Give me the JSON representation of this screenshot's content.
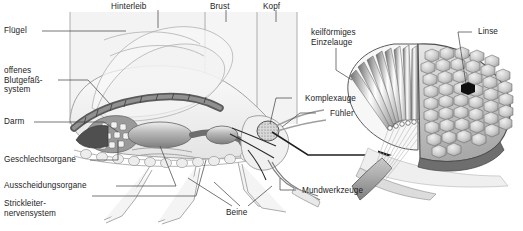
{
  "figure": {
    "kind": "anatomical-diagram",
    "language": "de"
  },
  "body_regions": [
    {
      "id": "hinterleib",
      "label": "Hinterleib"
    },
    {
      "id": "brust",
      "label": "Brust"
    },
    {
      "id": "kopf",
      "label": "Kopf"
    }
  ],
  "labels_left": [
    {
      "id": "fluegel",
      "label": "Flügel"
    },
    {
      "id": "blutgefaesssystem",
      "label": "offenes\nBlutgefäß-\nsystem"
    },
    {
      "id": "darm",
      "label": "Darm"
    },
    {
      "id": "geschlechtsorgane",
      "label": "Geschlechtsorgane"
    },
    {
      "id": "ausscheidungsorgane",
      "label": "Ausscheidungsorgane"
    },
    {
      "id": "strickleiternervensystem",
      "label": "Strickleiter-\nnervensystem"
    }
  ],
  "labels_right": [
    {
      "id": "einzelauge",
      "label": "keilförmiges\nEinzelauge"
    },
    {
      "id": "komplexauge",
      "label": "Komplexauge"
    },
    {
      "id": "fuehler",
      "label": "Fühler"
    },
    {
      "id": "mundwerkzeuge",
      "label": "Mundwerkzeuge"
    },
    {
      "id": "linse",
      "label": "Linse"
    }
  ],
  "labels_bottom": [
    {
      "id": "beine",
      "label": "Beine"
    }
  ],
  "colors": {
    "background": "#ffffff",
    "panel_tint": "#f2f2f2",
    "leader_line": "#4a4a4a",
    "outline": "#6f6f6f",
    "organ_dark": "#5d5d5d",
    "organ_mid": "#8e8e8e",
    "organ_light": "#cfcfcf",
    "facet_fill": "#d2d2d2",
    "facet_edge": "#6a6a6a",
    "lens_marker": "#101010",
    "text": "#1d1d1d"
  }
}
